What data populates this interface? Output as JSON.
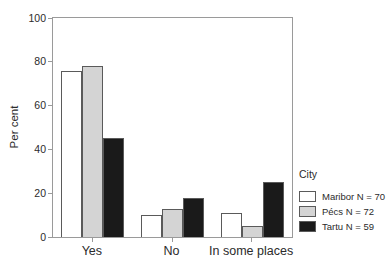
{
  "chart_data": {
    "type": "bar",
    "categories": [
      "Yes",
      "No",
      "In some places"
    ],
    "series": [
      {
        "name": "Maribor N = 70",
        "color": "#ffffff",
        "values": [
          76,
          10,
          11
        ]
      },
      {
        "name": "Pécs N = 72",
        "color": "#d4d4d4",
        "values": [
          78,
          13,
          5
        ]
      },
      {
        "name": "Tartu N = 59",
        "color": "#1a1a1a",
        "values": [
          45,
          18,
          25
        ]
      }
    ],
    "ylabel": "Per cent",
    "ylim": [
      0,
      100
    ],
    "yticks": [
      0,
      20,
      40,
      60,
      80,
      100
    ],
    "legend_title": "City",
    "legend_position": "right",
    "grid": false,
    "frame_color": "#9a9a9a",
    "bar_border_color": "#5a5a5a"
  }
}
